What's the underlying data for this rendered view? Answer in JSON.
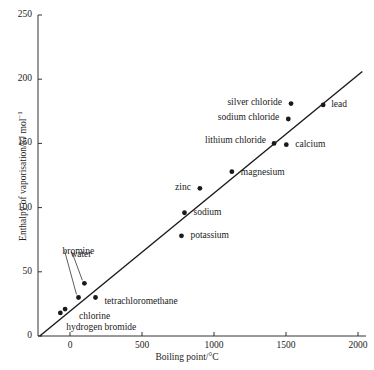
{
  "chart_data": {
    "type": "scatter",
    "title": "",
    "xlabel": "Boiling point/°C",
    "ylabel_html": "Enthalpy of vaporisation/kJ mol",
    "ylabel_exponent": "−1",
    "ylabel_plain": "Enthalpy of vaporisation/kJ mol⁻¹",
    "xlim": [
      -200,
      2000
    ],
    "ylim": [
      0,
      250
    ],
    "xticks": [
      0,
      500,
      1000,
      1500,
      2000
    ],
    "yticks": [
      0,
      50,
      100,
      150,
      200,
      250
    ],
    "xtick_labels": [
      "0",
      "500",
      "1000",
      "1500",
      "2000"
    ],
    "ytick_labels": [
      "0",
      "50",
      "100",
      "150",
      "200",
      "250"
    ],
    "grid": false,
    "legend": "none",
    "marker_color": "#1a1a1a",
    "line_color": "#1a1a1a",
    "trend_line": {
      "label": "best-fit line",
      "x_start": -210,
      "y_start": 0,
      "x_end": 2030,
      "y_end": 206
    },
    "points": [
      {
        "name": "hydrogen bromide",
        "x": -67,
        "y": 18,
        "label_dx": 6,
        "label_dy": 16,
        "align": "left",
        "leader": false
      },
      {
        "name": "chlorine",
        "x": -34,
        "y": 21,
        "label_dx": 14,
        "label_dy": 9,
        "align": "left",
        "leader": false
      },
      {
        "name": "bromine",
        "x": 59,
        "y": 30,
        "label_dx": -16,
        "label_dy": -44,
        "align": "left",
        "leader": true
      },
      {
        "name": "water",
        "x": 100,
        "y": 41,
        "label_dx": -14,
        "label_dy": -27,
        "align": "left",
        "leader": true
      },
      {
        "name": "tetrachloromethane",
        "x": 177,
        "y": 30,
        "label_dx": 9,
        "label_dy": 6,
        "align": "left",
        "leader": false
      },
      {
        "name": "potassium",
        "x": 774,
        "y": 78,
        "label_dx": 9,
        "label_dy": 1,
        "align": "left",
        "leader": false
      },
      {
        "name": "sodium",
        "x": 795,
        "y": 96,
        "label_dx": 9,
        "label_dy": 1,
        "align": "left",
        "leader": false
      },
      {
        "name": "zinc",
        "x": 902,
        "y": 115,
        "label_dx": -9,
        "label_dy": 1,
        "align": "right",
        "leader": false
      },
      {
        "name": "magnesium",
        "x": 1124,
        "y": 128,
        "label_dx": 9,
        "label_dy": 2,
        "align": "left",
        "leader": false
      },
      {
        "name": "lithium chloride",
        "x": 1417,
        "y": 150,
        "label_dx": -8,
        "label_dy": -1,
        "align": "right",
        "leader": false
      },
      {
        "name": "calcium",
        "x": 1502,
        "y": 149,
        "label_dx": 9,
        "label_dy": 1,
        "align": "left",
        "leader": false
      },
      {
        "name": "sodium chloride",
        "x": 1516,
        "y": 169,
        "label_dx": -9,
        "label_dy": 0,
        "align": "right",
        "leader": false
      },
      {
        "name": "silver chloride",
        "x": 1535,
        "y": 181,
        "label_dx": -9,
        "label_dy": 0,
        "align": "right",
        "leader": false
      },
      {
        "name": "lead",
        "x": 1758,
        "y": 180,
        "label_dx": 8,
        "label_dy": 1,
        "align": "left",
        "leader": false
      }
    ]
  }
}
